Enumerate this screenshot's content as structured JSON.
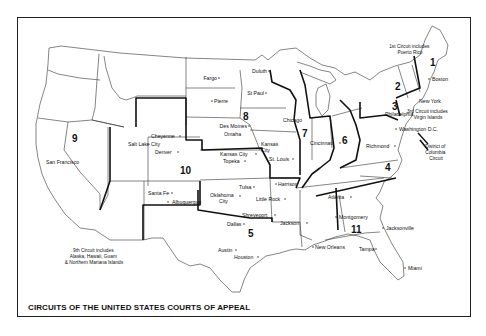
{
  "map": {
    "title": "CIRCUITS OF THE UNITED STATES COURTS OF APPEAL",
    "circuits": [
      {
        "number": "1",
        "x": 432,
        "y": 62
      },
      {
        "number": "2",
        "x": 398,
        "y": 87
      },
      {
        "number": "3",
        "x": 393,
        "y": 108
      },
      {
        "number": "4",
        "x": 388,
        "y": 168
      },
      {
        "number": "5",
        "x": 251,
        "y": 236
      },
      {
        "number": "6",
        "x": 346,
        "y": 140
      },
      {
        "number": "7",
        "x": 304,
        "y": 134
      },
      {
        "number": "8",
        "x": 246,
        "y": 120
      },
      {
        "number": "9",
        "x": 75,
        "y": 139
      },
      {
        "number": "10",
        "x": 180,
        "y": 171
      },
      {
        "number": "11",
        "x": 348,
        "y": 231
      }
    ],
    "cities": [
      {
        "name": "Fargo",
        "x": 217,
        "y": 79,
        "anchor": "end",
        "dotx": 219
      },
      {
        "name": "Duluth",
        "x": 267,
        "y": 72,
        "anchor": "end",
        "dotx": 269
      },
      {
        "name": "St Paul",
        "x": 264,
        "y": 94,
        "anchor": "end",
        "dotx": 266
      },
      {
        "name": "Pierre",
        "x": 214,
        "y": 102,
        "anchor": "start",
        "dotx": 212
      },
      {
        "name": "Des Moines",
        "x": 247,
        "y": 127,
        "anchor": "end",
        "dotx": 249
      },
      {
        "name": "Omaha",
        "x": 224,
        "y": 135,
        "anchor": "start",
        "dotx": 0
      },
      {
        "name": "Cheyenne",
        "x": 151,
        "y": 137,
        "anchor": "start",
        "dotx": 180
      },
      {
        "name": "Salt Lake City",
        "x": 128,
        "y": 145,
        "anchor": "start",
        "dotx": 0
      },
      {
        "name": "Denver",
        "x": 155,
        "y": 153,
        "anchor": "start",
        "dotx": 178
      },
      {
        "name": "Kansas City",
        "x": 220,
        "y": 155,
        "anchor": "start",
        "dotx": 256
      },
      {
        "name": "Topeka",
        "x": 223,
        "y": 162,
        "anchor": "start",
        "dotx": 245
      },
      {
        "name": "Kansas",
        "x": 261,
        "y": 145,
        "anchor": "start",
        "dotx": 0
      },
      {
        "name": "City",
        "x": 261,
        "y": 151,
        "anchor": "start",
        "dotx": 0
      },
      {
        "name": "St. Louis",
        "x": 269,
        "y": 160,
        "anchor": "start",
        "dotx": 293
      },
      {
        "name": "Chicago",
        "x": 283,
        "y": 121,
        "anchor": "start",
        "dotx": 0
      },
      {
        "name": "Cincinnati",
        "x": 310,
        "y": 144,
        "anchor": "start",
        "dotx": 340
      },
      {
        "name": "Philadelphia",
        "x": 385,
        "y": 115,
        "anchor": "start",
        "dotx": 0
      },
      {
        "name": "Richmond",
        "x": 366,
        "y": 147,
        "anchor": "start",
        "dotx": 395
      },
      {
        "name": "Washington D.C.",
        "x": 399,
        "y": 130,
        "anchor": "start",
        "dotx": 396
      },
      {
        "name": "Boston",
        "x": 432,
        "y": 80,
        "anchor": "start",
        "dotx": 429
      },
      {
        "name": "New York",
        "x": 419,
        "y": 102,
        "anchor": "start",
        "dotx": 0
      },
      {
        "name": "Harrison",
        "x": 278,
        "y": 185,
        "anchor": "start",
        "dotx": 276
      },
      {
        "name": "Tulsa",
        "x": 239,
        "y": 188,
        "anchor": "start",
        "dotx": 254
      },
      {
        "name": "Oklahoma",
        "x": 210,
        "y": 196,
        "anchor": "start",
        "dotx": 240
      },
      {
        "name": "City",
        "x": 219,
        "y": 202,
        "anchor": "start",
        "dotx": 0
      },
      {
        "name": "Little Rock",
        "x": 256,
        "y": 200,
        "anchor": "start",
        "dotx": 285
      },
      {
        "name": "Shreveport",
        "x": 242,
        "y": 216,
        "anchor": "start",
        "dotx": 275
      },
      {
        "name": "Jackson",
        "x": 280,
        "y": 224,
        "anchor": "start",
        "dotx": 307
      },
      {
        "name": "Dallas",
        "x": 227,
        "y": 225,
        "anchor": "start",
        "dotx": 244
      },
      {
        "name": "Austin",
        "x": 218,
        "y": 251,
        "anchor": "start",
        "dotx": 236
      },
      {
        "name": "Houston",
        "x": 234,
        "y": 258,
        "anchor": "start",
        "dotx": 258
      },
      {
        "name": "New Orleans",
        "x": 315,
        "y": 248,
        "anchor": "start",
        "dotx": 313
      },
      {
        "name": "Atlanta",
        "x": 328,
        "y": 198,
        "anchor": "start",
        "dotx": 351
      },
      {
        "name": "Montgomery",
        "x": 339,
        "y": 218,
        "anchor": "start",
        "dotx": 336
      },
      {
        "name": "Jacksonville",
        "x": 386,
        "y": 229,
        "anchor": "start",
        "dotx": 383
      },
      {
        "name": "Tampa",
        "x": 359,
        "y": 250,
        "anchor": "start",
        "dotx": 376
      },
      {
        "name": "Miami",
        "x": 408,
        "y": 269,
        "anchor": "start",
        "dotx": 405
      },
      {
        "name": "San Francisco",
        "x": 46,
        "y": 163,
        "anchor": "start",
        "dotx": 0
      },
      {
        "name": "Santa Fe",
        "x": 148,
        "y": 194,
        "anchor": "start",
        "dotx": 172
      },
      {
        "name": "Albuquerque",
        "x": 172,
        "y": 203,
        "anchor": "start",
        "dotx": 168
      }
    ],
    "notes": [
      {
        "lines": [
          "1st Circuit includes",
          "Puerto Rico"
        ],
        "x": 410,
        "y": 47
      },
      {
        "lines": [
          "3rd Circuit includes",
          "Virgin Islands"
        ],
        "x": 428,
        "y": 112
      },
      {
        "lines": [
          "District of",
          "Columbia",
          "Circuit"
        ],
        "x": 436,
        "y": 147
      },
      {
        "lines": [
          "9th Circuit includes",
          "Alaska, Hawaii, Guam",
          "& Northern Mariana Islands"
        ],
        "x": 94,
        "y": 251
      }
    ]
  }
}
